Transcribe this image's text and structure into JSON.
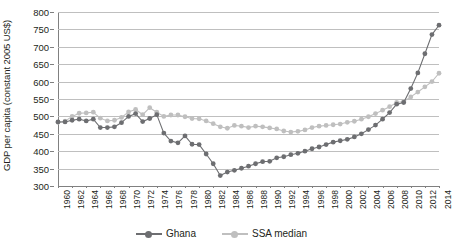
{
  "chart_data": {
    "type": "line",
    "title": "",
    "xlabel": "",
    "ylabel": "GDP per capita (constant 2005 US$)",
    "ylim": [
      300,
      800
    ],
    "y_ticks": [
      300,
      350,
      400,
      450,
      500,
      550,
      600,
      650,
      700,
      750,
      800
    ],
    "grid": true,
    "legend_position": "bottom-center",
    "xlim": [
      1960,
      2014
    ],
    "x_tick_step": 2,
    "x_tick_labels": [
      "1960",
      "1962",
      "1964",
      "1966",
      "1968",
      "1970",
      "1972",
      "1974",
      "1976",
      "1978",
      "1980",
      "1982",
      "1984",
      "1986",
      "1988",
      "1990",
      "1992",
      "1994",
      "1996",
      "1998",
      "2000",
      "2002",
      "2004",
      "2006",
      "2008",
      "2010",
      "2012",
      "2014"
    ],
    "x": [
      1960,
      1961,
      1962,
      1963,
      1964,
      1965,
      1966,
      1967,
      1968,
      1969,
      1970,
      1971,
      1972,
      1973,
      1974,
      1975,
      1976,
      1977,
      1978,
      1979,
      1980,
      1981,
      1982,
      1983,
      1984,
      1985,
      1986,
      1987,
      1988,
      1989,
      1990,
      1991,
      1992,
      1993,
      1994,
      1995,
      1996,
      1997,
      1998,
      1999,
      2000,
      2001,
      2002,
      2003,
      2004,
      2005,
      2006,
      2007,
      2008,
      2009,
      2010,
      2011,
      2012,
      2013,
      2014
    ],
    "series": [
      {
        "name": "Ghana",
        "color": "#6d6e71",
        "marker": "circle",
        "values": [
          484,
          484,
          489,
          492,
          487,
          492,
          468,
          468,
          470,
          482,
          500,
          508,
          485,
          494,
          505,
          452,
          429,
          424,
          444,
          420,
          419,
          392,
          364,
          330,
          340,
          345,
          351,
          357,
          364,
          370,
          371,
          381,
          384,
          390,
          394,
          400,
          407,
          412,
          419,
          426,
          430,
          434,
          441,
          450,
          462,
          475,
          492,
          511,
          535,
          540,
          580,
          625,
          680,
          735,
          762
        ]
      },
      {
        "name": "SSA median",
        "color": "#bfbfbf",
        "marker": "circle",
        "values": [
          483,
          486,
          500,
          509,
          510,
          512,
          495,
          487,
          489,
          497,
          513,
          520,
          505,
          525,
          512,
          500,
          504,
          504,
          499,
          494,
          493,
          487,
          479,
          470,
          466,
          474,
          472,
          468,
          472,
          470,
          467,
          464,
          458,
          455,
          457,
          461,
          468,
          472,
          474,
          476,
          478,
          483,
          486,
          492,
          499,
          508,
          518,
          528,
          540,
          543,
          556,
          570,
          585,
          600,
          624
        ]
      }
    ]
  },
  "legend": {
    "items": [
      {
        "label": "Ghana"
      },
      {
        "label": "SSA median"
      }
    ]
  }
}
